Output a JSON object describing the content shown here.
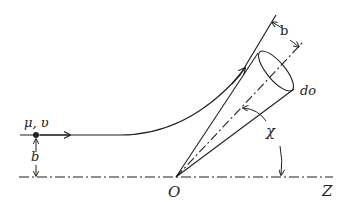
{
  "diagram": {
    "labels": {
      "particle": "μ, υ",
      "impact_parameter_left": "b",
      "impact_parameter_right": "b",
      "solid_angle": "do",
      "angle": "χ",
      "origin": "O",
      "axis": "Z"
    },
    "colors": {
      "ink": "#222222",
      "background": "#ffffff"
    }
  }
}
